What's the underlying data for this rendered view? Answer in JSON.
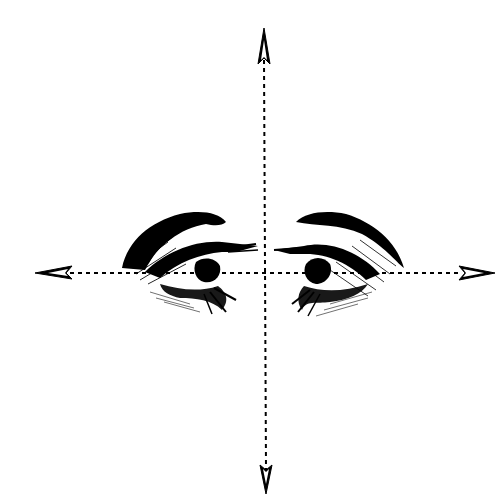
{
  "figure": {
    "background": "#ffffff",
    "ink": "#000000",
    "axes": {
      "vertical": {
        "x": 264,
        "y_start": 28,
        "y_end": 494,
        "style": "dashed"
      },
      "horizontal": {
        "y": 273,
        "x_start": 35,
        "x_end": 495,
        "style": "dashed"
      }
    },
    "arrowheads": [
      "up",
      "down",
      "left",
      "right"
    ],
    "eyes": [
      {
        "side": "left",
        "facing": "right",
        "label": "left eye"
      },
      {
        "side": "right",
        "facing": "left",
        "label": "right eye"
      }
    ]
  }
}
